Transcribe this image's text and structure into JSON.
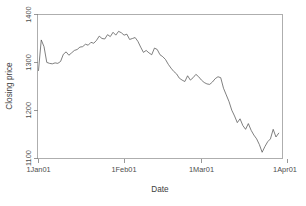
{
  "figure": {
    "background_color": "#ffffff",
    "line_color": "#555555",
    "axis_color": "#808080",
    "text_color": "#4d4d4d",
    "width": 306,
    "height": 206
  },
  "axes": {
    "x_title": "Date",
    "y_title": "Closing price",
    "x_ticks": [
      "1Jan01",
      "1Feb01",
      "1Mar01",
      "1Apr01"
    ],
    "y_ticks": [
      "1100",
      "1200",
      "1300",
      "1400"
    ]
  },
  "chart_data": {
    "type": "line",
    "title": "",
    "subtitle": "",
    "xlabel": "Date",
    "ylabel": "Closing price",
    "xlim": [
      "1Jan01",
      "1Apr01"
    ],
    "ylim": [
      1100,
      1400
    ],
    "grid": false,
    "legend": null,
    "x_tick_labels": [
      "1Jan01",
      "1Feb01",
      "1Mar01",
      "1Apr01"
    ],
    "y_tick_labels": [
      1100,
      1200,
      1300,
      1400
    ],
    "x_tick_positions": [
      0,
      31,
      59,
      90
    ],
    "x_unit": "days since 1Jan01",
    "series": [
      {
        "name": "Closing price",
        "x": [
          0,
          1,
          2,
          3,
          4,
          5,
          6,
          7,
          8,
          9,
          10,
          11,
          12,
          13,
          14,
          15,
          16,
          17,
          18,
          19,
          20,
          21,
          22,
          23,
          24,
          25,
          26,
          27,
          28,
          29,
          30,
          31,
          32,
          33,
          34,
          35,
          36,
          37,
          38,
          39,
          40,
          41,
          42,
          43,
          44,
          45,
          46,
          47,
          48,
          49,
          50,
          51,
          52,
          53,
          54,
          55,
          56,
          57,
          58,
          59,
          60,
          61,
          62,
          63,
          64,
          65,
          66,
          67,
          68,
          69,
          70,
          71,
          72,
          73,
          74,
          75,
          76,
          77,
          78,
          79,
          80,
          81,
          82,
          83,
          84,
          85,
          86,
          87
        ],
        "values": [
          1283,
          1347,
          1333,
          1300,
          1298,
          1297,
          1299,
          1298,
          1302,
          1317,
          1322,
          1315,
          1320,
          1325,
          1327,
          1332,
          1333,
          1338,
          1336,
          1342,
          1340,
          1346,
          1355,
          1350,
          1349,
          1358,
          1354,
          1363,
          1357,
          1365,
          1362,
          1357,
          1359,
          1348,
          1350,
          1352,
          1344,
          1332,
          1321,
          1325,
          1320,
          1316,
          1330,
          1327,
          1316,
          1312,
          1306,
          1296,
          1288,
          1281,
          1276,
          1267,
          1263,
          1260,
          1272,
          1263,
          1268,
          1275,
          1270,
          1263,
          1258,
          1255,
          1254,
          1259,
          1266,
          1270,
          1268,
          1246,
          1232,
          1218,
          1200,
          1188,
          1174,
          1182,
          1168,
          1160,
          1172,
          1158,
          1148,
          1140,
          1128,
          1112,
          1124,
          1134,
          1140,
          1160,
          1144,
          1152
        ]
      }
    ]
  }
}
